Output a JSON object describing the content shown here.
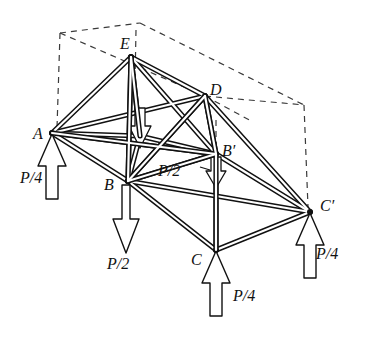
{
  "figure": {
    "kind": "space-truss-free-body-diagram",
    "line_color": "#111111",
    "dashed_color": "#444444",
    "background_color": "#ffffff"
  },
  "nodes": [
    {
      "id": "A",
      "label": "A",
      "x": 52,
      "y": 133,
      "label_x": 33,
      "label_y": 126
    },
    {
      "id": "B",
      "label": "B",
      "x": 128,
      "y": 181,
      "label_x": 104,
      "label_y": 177
    },
    {
      "id": "C",
      "label": "C",
      "x": 216,
      "y": 250,
      "label_x": 191,
      "label_y": 252
    },
    {
      "id": "Cp",
      "label": "C′",
      "x": 310,
      "y": 212,
      "label_x": 320,
      "label_y": 198
    },
    {
      "id": "Bp",
      "label": "B′",
      "x": 216,
      "y": 154,
      "label_x": 222,
      "label_y": 143
    },
    {
      "id": "D",
      "label": "D",
      "x": 205,
      "y": 96,
      "label_x": 210,
      "label_y": 82
    },
    {
      "id": "E",
      "label": "E",
      "x": 131,
      "y": 57,
      "label_x": 120,
      "label_y": 36
    },
    {
      "id": "Ap",
      "label": "",
      "x": 140,
      "y": 136,
      "label_x": 0,
      "label_y": 0
    }
  ],
  "loads": [
    {
      "at": "A",
      "label": "P/4",
      "label_x": 20,
      "label_y": 170,
      "size": "small"
    },
    {
      "at": "B",
      "label": "P/2",
      "label_x": 107,
      "label_y": 256,
      "size": "large"
    },
    {
      "at": "C",
      "label": "P/4",
      "label_x": 233,
      "label_y": 288,
      "size": "small"
    },
    {
      "at": "Cp",
      "label": "P/4",
      "label_x": 316,
      "label_y": 246,
      "size": "small"
    },
    {
      "at": "Bp",
      "label": "P/2",
      "label_x": 158,
      "label_y": 163,
      "size": "hidden"
    },
    {
      "at": "Ap",
      "label": "",
      "label_x": 0,
      "label_y": 0,
      "size": "hidden"
    }
  ],
  "members": [
    {
      "from": "E",
      "to": "A"
    },
    {
      "from": "E",
      "to": "B"
    },
    {
      "from": "E",
      "to": "D"
    },
    {
      "from": "E",
      "to": "Bp"
    },
    {
      "from": "E",
      "to": "Ap"
    },
    {
      "from": "A",
      "to": "B"
    },
    {
      "from": "A",
      "to": "Ap"
    },
    {
      "from": "A",
      "to": "Bp"
    },
    {
      "from": "A",
      "to": "D"
    },
    {
      "from": "B",
      "to": "C"
    },
    {
      "from": "B",
      "to": "Bp"
    },
    {
      "from": "B",
      "to": "Cp"
    },
    {
      "from": "B",
      "to": "D"
    },
    {
      "from": "B",
      "to": "Ap"
    },
    {
      "from": "C",
      "to": "Cp"
    },
    {
      "from": "C",
      "to": "Bp"
    },
    {
      "from": "D",
      "to": "Bp"
    },
    {
      "from": "D",
      "to": "Cp"
    },
    {
      "from": "Bp",
      "to": "Cp"
    },
    {
      "from": "Ap",
      "to": "Bp"
    }
  ],
  "construction_box": {
    "style": "dashed",
    "corners": {
      "top_back_left": {
        "x": 60,
        "y": 33
      },
      "top_back_right": {
        "x": 304,
        "y": 105
      },
      "top_front_mid": {
        "x": 140,
        "y": 23
      },
      "apex_over_E": {
        "x": 136,
        "y": 52
      }
    }
  }
}
